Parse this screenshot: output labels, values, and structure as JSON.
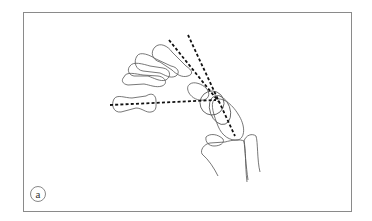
{
  "figure": {
    "panel_label": "a",
    "colors": {
      "outline": "#555555",
      "axis_lines": "#111111",
      "frame": "#8a8a8a",
      "background": "#ffffff"
    },
    "elements": {
      "metacarpals_count": 5,
      "axis_lines": [
        {
          "name": "metacarpal-axis-1",
          "style": "dashed"
        },
        {
          "name": "metacarpal-axis-2",
          "style": "dashed"
        },
        {
          "name": "horizontal-axis",
          "style": "dashed"
        }
      ]
    }
  }
}
